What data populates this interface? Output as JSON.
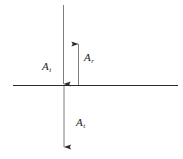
{
  "figure": {
    "background_color": "#ffffff",
    "line_color": "#2b2b2b",
    "label_color": "#1a1a1a",
    "width": 183,
    "height": 159
  },
  "interface": {
    "name": "horizontal interface line",
    "x_start": 13,
    "x_end": 178,
    "y": 85
  },
  "vectors": [
    {
      "id": "incident",
      "base": "A",
      "subscript": "i",
      "direction": "down",
      "x": 63,
      "y_tail": 5,
      "y_head": 85,
      "label_x": 42,
      "label_y": 61
    },
    {
      "id": "reflected",
      "base": "A",
      "subscript": "r",
      "direction": "up",
      "x": 78,
      "y_tail": 85,
      "y_head": 42,
      "label_x": 84,
      "label_y": 52
    },
    {
      "id": "transmitted",
      "base": "A",
      "subscript": "t",
      "direction": "down",
      "x": 64,
      "y_tail": 85,
      "y_head": 148,
      "label_x": 76,
      "label_y": 117
    }
  ],
  "labels": {
    "incident": {
      "base": "A",
      "sub": "i"
    },
    "reflected": {
      "base": "A",
      "sub": "r"
    },
    "transmitted": {
      "base": "A",
      "sub": "t"
    }
  }
}
